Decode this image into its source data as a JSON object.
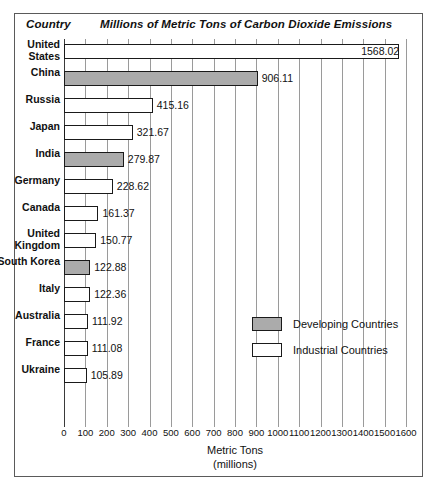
{
  "header": {
    "country_label": "Country",
    "title": "Millions of Metric Tons of Carbon Dioxide Emissions"
  },
  "legend": {
    "developing_label": "Developing Countries",
    "industrial_label": "Industrial Countries",
    "developing_color": "#ababab",
    "industrial_color": "#ffffff"
  },
  "axis": {
    "title_line1": "Metric Tons",
    "title_line2": "(millions)"
  },
  "chart_data": {
    "type": "bar",
    "orientation": "horizontal",
    "title": "Millions of Metric Tons of Carbon Dioxide Emissions",
    "xlabel": "Metric Tons (millions)",
    "ylabel": "Country",
    "xlim": [
      0,
      1600
    ],
    "grid": true,
    "legend_position": "middle-right",
    "tick_labels": [
      "0",
      "100",
      "200",
      "300",
      "400",
      "500",
      "600",
      "700",
      "800",
      "900",
      "1000",
      "1100",
      "1200",
      "1300",
      "1400",
      "1500",
      "1600"
    ],
    "tick_values": [
      0,
      100,
      200,
      300,
      400,
      500,
      600,
      700,
      800,
      900,
      1000,
      1100,
      1200,
      1300,
      1400,
      1500,
      1600
    ],
    "categories": [
      "United States",
      "China",
      "Russia",
      "Japan",
      "India",
      "Germany",
      "Canada",
      "United Kingdom",
      "South Korea",
      "Italy",
      "Australia",
      "France",
      "Ukraine"
    ],
    "values": [
      1568.02,
      906.11,
      415.16,
      321.67,
      279.87,
      228.62,
      161.37,
      150.77,
      122.88,
      122.36,
      111.92,
      111.08,
      105.89
    ],
    "value_labels": [
      "1568.02",
      "906.11",
      "415.16",
      "321.67",
      "279.87",
      "228.62",
      "161.37",
      "150.77",
      "122.88",
      "122.36",
      "111.92",
      "111.08",
      "105.89"
    ],
    "groups": [
      "Industrial",
      "Developing",
      "Industrial",
      "Industrial",
      "Developing",
      "Industrial",
      "Industrial",
      "Industrial",
      "Developing",
      "Industrial",
      "Industrial",
      "Industrial",
      "Industrial"
    ],
    "series": [
      {
        "name": "CO2 Emissions",
        "points": [
          {
            "country": "United States",
            "value": 1568.02,
            "label": "1568.02",
            "group": "Industrial",
            "label_inside": true
          },
          {
            "country": "China",
            "value": 906.11,
            "label": "906.11",
            "group": "Developing",
            "label_inside": false
          },
          {
            "country": "Russia",
            "value": 415.16,
            "label": "415.16",
            "group": "Industrial",
            "label_inside": false
          },
          {
            "country": "Japan",
            "value": 321.67,
            "label": "321.67",
            "group": "Industrial",
            "label_inside": false
          },
          {
            "country": "India",
            "value": 279.87,
            "label": "279.87",
            "group": "Developing",
            "label_inside": false
          },
          {
            "country": "Germany",
            "value": 228.62,
            "label": "228.62",
            "group": "Industrial",
            "label_inside": false
          },
          {
            "country": "Canada",
            "value": 161.37,
            "label": "161.37",
            "group": "Industrial",
            "label_inside": false
          },
          {
            "country": "United Kingdom",
            "value": 150.77,
            "label": "150.77",
            "group": "Industrial",
            "label_inside": false
          },
          {
            "country": "South Korea",
            "value": 122.88,
            "label": "122.88",
            "group": "Developing",
            "label_inside": false
          },
          {
            "country": "Italy",
            "value": 122.36,
            "label": "122.36",
            "group": "Industrial",
            "label_inside": false
          },
          {
            "country": "Australia",
            "value": 111.92,
            "label": "111.92",
            "group": "Industrial",
            "label_inside": false
          },
          {
            "country": "France",
            "value": 111.08,
            "label": "111.08",
            "group": "Industrial",
            "label_inside": false
          },
          {
            "country": "Ukraine",
            "value": 105.89,
            "label": "105.89",
            "group": "Industrial",
            "label_inside": false
          }
        ]
      }
    ]
  }
}
